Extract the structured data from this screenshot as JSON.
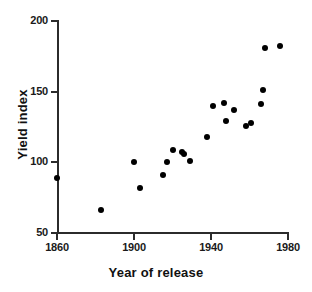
{
  "chart_data": {
    "type": "scatter",
    "title": "",
    "xlabel": "Year of release",
    "ylabel": "Yield index",
    "xlim": [
      1860,
      1980
    ],
    "ylim": [
      50,
      200
    ],
    "xticks": [
      1860,
      1900,
      1940,
      1980
    ],
    "yticks": [
      50,
      100,
      150,
      200
    ],
    "grid": false,
    "legend": null,
    "marker": "filled-circle",
    "marker_color": "#000000",
    "points": [
      {
        "x": 1860,
        "y": 89
      },
      {
        "x": 1883,
        "y": 66
      },
      {
        "x": 1900,
        "y": 100
      },
      {
        "x": 1903,
        "y": 82
      },
      {
        "x": 1915,
        "y": 91
      },
      {
        "x": 1917,
        "y": 100
      },
      {
        "x": 1920,
        "y": 109
      },
      {
        "x": 1925,
        "y": 107
      },
      {
        "x": 1926,
        "y": 106
      },
      {
        "x": 1929,
        "y": 101
      },
      {
        "x": 1938,
        "y": 118
      },
      {
        "x": 1941,
        "y": 140
      },
      {
        "x": 1947,
        "y": 142
      },
      {
        "x": 1948,
        "y": 129
      },
      {
        "x": 1952,
        "y": 137
      },
      {
        "x": 1958,
        "y": 126
      },
      {
        "x": 1961,
        "y": 128
      },
      {
        "x": 1966,
        "y": 141
      },
      {
        "x": 1967,
        "y": 151
      },
      {
        "x": 1968,
        "y": 181
      },
      {
        "x": 1976,
        "y": 182
      }
    ]
  },
  "axis": {
    "x_tick_labels": [
      "1860",
      "1900",
      "1940",
      "1980"
    ],
    "y_tick_labels": [
      "50",
      "100",
      "150",
      "200"
    ],
    "x_title": "Year of release",
    "y_title": "Yield index"
  },
  "colors": {
    "axis": "#2b2b2b",
    "marker": "#000000",
    "text": "#111111",
    "background": "#ffffff"
  }
}
